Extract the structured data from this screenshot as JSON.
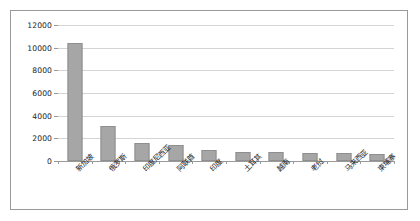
{
  "chart_data": {
    "type": "bar",
    "title": "",
    "subtitle": "",
    "xlabel": "",
    "ylabel": "",
    "categories": [
      "新加坡",
      "俄罗斯",
      "印度尼西亚",
      "阿联酋",
      "印度",
      "土耳其",
      "越南",
      "老挝",
      "马来西亚",
      "柬埔寨"
    ],
    "values": [
      10400,
      3100,
      1600,
      1400,
      1000,
      800,
      800,
      750,
      700,
      650
    ],
    "ylim": [
      0,
      12000
    ],
    "ytick_labels": [
      "0",
      "2000",
      "4000",
      "6000",
      "8000",
      "10000",
      "12000"
    ],
    "ytick_values": [
      0,
      2000,
      4000,
      6000,
      8000,
      10000,
      12000
    ],
    "grid": true,
    "legend": false,
    "legend_position": "none",
    "series": [
      {
        "name": "",
        "values": [
          10400,
          3100,
          1600,
          1400,
          1000,
          800,
          800,
          750,
          700,
          650
        ]
      }
    ],
    "colors": {
      "bar_fill": "#a6a6a6",
      "bar_border": "#8f8f8f",
      "gridline": "#d4d4d4",
      "axis": "#9a9a9a",
      "text": "#1a1a1a",
      "background": "#ffffff",
      "frame_border": "#9a9a9a"
    },
    "xlabel_rotation": -45
  }
}
